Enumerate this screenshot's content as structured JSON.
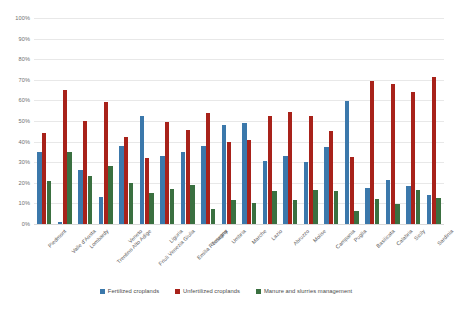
{
  "chart_data": {
    "type": "bar",
    "title": "",
    "subtitle": "",
    "xlabel": "",
    "ylabel": "",
    "ylim": [
      0,
      100
    ],
    "yticks": [
      "0%",
      "10%",
      "20%",
      "30%",
      "40%",
      "50%",
      "60%",
      "70%",
      "80%",
      "90%",
      "100%"
    ],
    "ytick_values": [
      0,
      10,
      20,
      30,
      40,
      50,
      60,
      70,
      80,
      90,
      100
    ],
    "grid": true,
    "legend_position": "bottom",
    "unit": "%",
    "categories": [
      "Piedmont",
      "Valle d'Aosta",
      "Lombardy",
      "Trentino Alto Adige",
      "Veneto",
      "Friuli Venezia Giulia",
      "Liguria",
      "Emilia Romagna",
      "Tuscany",
      "Umbria",
      "Marche",
      "Lazio",
      "Abruzzo",
      "Molise",
      "Campania",
      "Puglia",
      "Basilicata",
      "Calabria",
      "Sicily",
      "Sardinia"
    ],
    "series": [
      {
        "name": "Fertilized croplands",
        "color": "#3b78ab",
        "values": [
          35,
          1,
          26,
          13,
          38,
          52.5,
          33,
          35,
          38,
          48,
          49,
          30.5,
          33,
          30,
          37.5,
          59.5,
          17.5,
          21.5,
          18.5,
          14
        ]
      },
      {
        "name": "Unfertilized croplands",
        "color": "#a8221a",
        "values": [
          44,
          65,
          50,
          59,
          42,
          32,
          49.5,
          45.5,
          54,
          40,
          41,
          52.5,
          54.5,
          52.5,
          45,
          32.5,
          69.5,
          68,
          64,
          71.5
        ]
      },
      {
        "name": "Manure and slurries management",
        "color": "#3a7040",
        "values": [
          21,
          35,
          23.5,
          28,
          20,
          15,
          17,
          19,
          7.5,
          11.5,
          10,
          16,
          11.5,
          16.5,
          16,
          6.5,
          12,
          9.5,
          16.5,
          12.5
        ]
      }
    ]
  },
  "legend": {
    "items": [
      {
        "label": "Fertilized croplands",
        "color": "#3b78ab"
      },
      {
        "label": "Unfertilized croplands",
        "color": "#a8221a"
      },
      {
        "label": "Manure and slurries management",
        "color": "#3a7040"
      }
    ]
  }
}
